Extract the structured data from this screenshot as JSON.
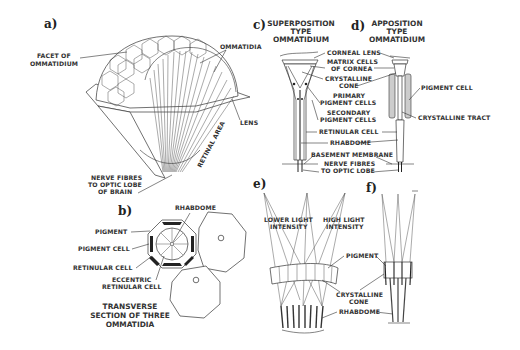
{
  "figure": {
    "panels": {
      "a": {
        "letter": "a)",
        "labels": {
          "facet_1": "FACET OF",
          "facet_2": "OMMATIDIUM",
          "ommatidia": "OMMATIDIA",
          "lens": "LENS",
          "retinal_area": "RETINAL AREA",
          "nerve_1": "NERVE FIBRES",
          "nerve_2": "TO OPTIC LOBE",
          "nerve_3": "OF BRAIN"
        }
      },
      "b": {
        "letter": "b)",
        "labels": {
          "rhabdome": "RHABDOME",
          "pigment": "PIGMENT",
          "pigment_cell": "PIGMENT CELL",
          "retinular_cell": "RETINULAR CELL",
          "eccentric_1": "ECCENTRIC",
          "eccentric_2": "RETINULAR CELL"
        },
        "caption_1": "TRANSVERSE",
        "caption_2": "SECTION OF THREE",
        "caption_3": "OMMATIDIA"
      },
      "c": {
        "letter": "c)",
        "title_1": "SUPERPOSITION",
        "title_2": "TYPE",
        "title_3": "OMMATIDIUM"
      },
      "d": {
        "letter": "d)",
        "title_1": "APPOSITION",
        "title_2": "TYPE",
        "title_3": "OMMATIDIUM",
        "labels": {
          "pigment_cell": "PIGMENT CELL",
          "crystalline_tract": "CRYSTALLINE TRACT"
        }
      },
      "cd_shared": {
        "corneal_lens": "CORNEAL LENS",
        "matrix_1": "MATRIX CELLS",
        "matrix_2": "OF CORNEA",
        "cone_1": "CRYSTALLINE",
        "cone_2": "CONE",
        "primary_1": "PRIMARY",
        "primary_2": "PIGMENT CELLS",
        "secondary_1": "SECONDARY",
        "secondary_2": "PIGMENT CELLS",
        "retinular_cell": "RETINULAR CELL",
        "rhabdome": "RHABDOME",
        "basement": "BASEMENT MEMBRANE",
        "nerve_1": "NERVE FIBRES",
        "nerve_2": "TO OPTIC LOBE"
      },
      "e": {
        "letter": "e)",
        "labels": {
          "lower_1": "LOWER LIGHT",
          "lower_2": "INTENSITY",
          "high_1": "HIGH LIGHT",
          "high_2": "INTENSITY"
        }
      },
      "ef_shared": {
        "pigment": "PIGMENT",
        "cone_1": "CRYSTALLINE",
        "cone_2": "CONE",
        "rhabdome": "RHABDOME"
      },
      "f": {
        "letter": "f)"
      }
    }
  }
}
